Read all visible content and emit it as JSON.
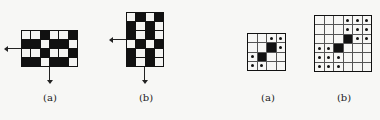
{
  "figures": [
    {
      "id": "left-a",
      "label": "(a)",
      "rows": 4,
      "cols": 6,
      "cells": [
        [
          "W",
          "W",
          "B",
          "W",
          "W",
          "B"
        ],
        [
          "B",
          "B",
          "W",
          "B",
          "B",
          "W"
        ],
        [
          "W",
          "W",
          "B",
          "W",
          "W",
          "B"
        ],
        [
          "B",
          "B",
          "W",
          "B",
          "B",
          "W"
        ]
      ],
      "arrows": [
        "left",
        "down"
      ]
    },
    {
      "id": "left-b",
      "label": "(b)",
      "rows": 6,
      "cols": 4,
      "cells": [
        [
          "W",
          "B",
          "W",
          "B"
        ],
        [
          "B",
          "W",
          "B",
          "W"
        ],
        [
          "B",
          "W",
          "B",
          "W"
        ],
        [
          "W",
          "B",
          "W",
          "B"
        ],
        [
          "B",
          "W",
          "B",
          "W"
        ],
        [
          "B",
          "W",
          "B",
          "W"
        ]
      ],
      "arrows": [
        "left",
        "down"
      ]
    },
    {
      "id": "right-a",
      "label": "(a)",
      "rows": 4,
      "cols": 4,
      "cells": [
        [
          "_",
          "_",
          "D",
          "D"
        ],
        [
          "_",
          "_",
          "B",
          "D"
        ],
        [
          "D",
          "B",
          "_",
          "_"
        ],
        [
          "D",
          "D",
          "_",
          "_"
        ]
      ]
    },
    {
      "id": "right-b",
      "label": "(b)",
      "rows": 6,
      "cols": 6,
      "cells": [
        [
          "_",
          "_",
          "_",
          "D",
          "D",
          "D"
        ],
        [
          "_",
          "_",
          "_",
          "D",
          "D",
          "D"
        ],
        [
          "_",
          "_",
          "_",
          "B",
          "D",
          "D"
        ],
        [
          "D",
          "D",
          "B",
          "_",
          "_",
          "_"
        ],
        [
          "D",
          "D",
          "D",
          "_",
          "_",
          "_"
        ],
        [
          "D",
          "D",
          "D",
          "_",
          "_",
          "_"
        ]
      ]
    }
  ],
  "legend": {
    "B": "black cell",
    "W": "white cell",
    "D": "dotted cell",
    "_": "empty cell"
  }
}
